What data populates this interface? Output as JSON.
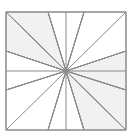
{
  "figure": {
    "type": "geometric-diagram",
    "canvas": {
      "width": 135,
      "height": 140,
      "background": "#ffffff"
    },
    "square": {
      "x": 6,
      "y": 12,
      "width": 120,
      "height": 118,
      "stroke": "#8a8a8a",
      "stroke_width": 1,
      "fill": "#ffffff"
    },
    "center": {
      "x": 66,
      "y": 71
    },
    "midlines": {
      "stroke": "#8a8a8a",
      "stroke_width": 1,
      "horizontal_y": 71,
      "vertical_x": 66
    },
    "edge_points": {
      "top": [
        48,
        84
      ],
      "bottom": [
        48,
        84
      ],
      "left": [
        51,
        90
      ],
      "right": [
        51,
        90
      ]
    },
    "colors": {
      "shaded_fill": "#f1f1f1",
      "white_fill": "#ffffff",
      "line": "#8a8a8a"
    },
    "triangles": [
      {
        "name": "top-left-upper",
        "shaded": true,
        "points": "6,12 48,12 66,71"
      },
      {
        "name": "top-left-lower",
        "shaded": true,
        "points": "6,12 6,51 66,71"
      },
      {
        "name": "top-right-upper",
        "shaded": false,
        "points": "48,12 84,12 66,71"
      },
      {
        "name": "top-right-corner",
        "shaded": false,
        "points": "84,12 126,12 126,51 66,71"
      },
      {
        "name": "left-middle",
        "shaded": false,
        "points": "6,51 6,90 66,71"
      },
      {
        "name": "right-middle",
        "shaded": true,
        "points": "126,51 126,90 66,71"
      },
      {
        "name": "bottom-left-corner",
        "shaded": false,
        "points": "6,90 6,130 48,130 66,71"
      },
      {
        "name": "bottom-middle-left",
        "shaded": false,
        "points": "48,130 84,130 66,71"
      },
      {
        "name": "bottom-right-lower",
        "shaded": true,
        "points": "84,130 126,130 66,71"
      },
      {
        "name": "bottom-right-upper",
        "shaded": true,
        "points": "126,90 126,130 66,71"
      }
    ],
    "spokes": [
      {
        "name": "spoke-to-top-left-corner",
        "to": "6,12"
      },
      {
        "name": "spoke-to-top-third-1",
        "to": "48,12"
      },
      {
        "name": "spoke-to-top-third-2",
        "to": "84,12"
      },
      {
        "name": "spoke-to-top-right-corner",
        "to": "126,12"
      },
      {
        "name": "spoke-to-right-third-1",
        "to": "126,51"
      },
      {
        "name": "spoke-to-right-third-2",
        "to": "126,90"
      },
      {
        "name": "spoke-to-bottom-right-corner",
        "to": "126,130"
      },
      {
        "name": "spoke-to-bottom-third-2",
        "to": "84,130"
      },
      {
        "name": "spoke-to-bottom-third-1",
        "to": "48,130"
      },
      {
        "name": "spoke-to-bottom-left-corner",
        "to": "6,130"
      },
      {
        "name": "spoke-to-left-third-2",
        "to": "6,90"
      },
      {
        "name": "spoke-to-left-third-1",
        "to": "6,51"
      }
    ]
  }
}
